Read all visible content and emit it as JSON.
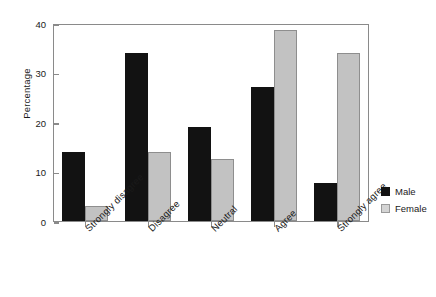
{
  "chart_data": {
    "type": "bar",
    "title": "",
    "xlabel": "",
    "ylabel": "Percentage",
    "ylim": [
      0,
      40
    ],
    "yticks": [
      0,
      10,
      20,
      30,
      40
    ],
    "ytick_labels": [
      "0",
      "10",
      "20",
      "30",
      "40"
    ],
    "grid": false,
    "legend_position": "right",
    "categories": [
      "Strongly disagree",
      "Disagree",
      "Neutral",
      "Agree",
      "Strongly agree"
    ],
    "series": [
      {
        "name": "Male",
        "color": "#121212",
        "values": [
          14,
          34,
          19,
          27,
          7.7
        ]
      },
      {
        "name": "Female",
        "color": "#c2c2c2",
        "values": [
          3,
          14,
          12.5,
          38.5,
          34
        ]
      }
    ]
  },
  "legend": {
    "items": [
      {
        "label": "Male",
        "swatch": "male-swatch"
      },
      {
        "label": "Female",
        "swatch": "female-swatch"
      }
    ]
  }
}
